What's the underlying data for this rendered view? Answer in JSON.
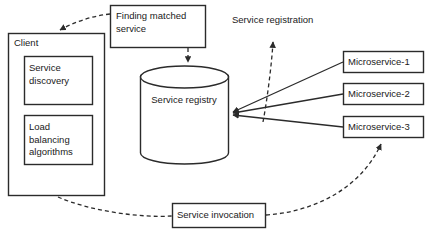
{
  "diagram": {
    "background_color": "#ffffff",
    "stroke_color": "#2b2b2b",
    "text_color": "#1a1a1a",
    "nodes": {
      "client": {
        "label": "Client",
        "shape": "rectangle"
      },
      "service_discovery": {
        "label": "Service\ndiscovery",
        "shape": "rectangle"
      },
      "load_balancing": {
        "label": "Load\nbalancing\nalgorithms",
        "shape": "rectangle"
      },
      "service_registry": {
        "label": "Service registry",
        "shape": "cylinder"
      },
      "finding_matched_service": {
        "label": "Finding matched\nservice",
        "shape": "rectangle"
      },
      "service_invocation": {
        "label": "Service invocation",
        "shape": "rectangle"
      },
      "service_registration": {
        "label": "Service registration",
        "shape": "text-label"
      },
      "microservice_1": {
        "label": "Microservice-1",
        "shape": "rectangle"
      },
      "microservice_2": {
        "label": "Microservice-2",
        "shape": "rectangle"
      },
      "microservice_3": {
        "label": "Microservice-3",
        "shape": "rectangle"
      }
    },
    "edges": [
      {
        "name": "finding-to-client",
        "from": "finding_matched_service",
        "to": "client",
        "style": "dashed",
        "arrow": true
      },
      {
        "name": "finding-to-registry",
        "from": "finding_matched_service",
        "to": "service_registry",
        "style": "dashed",
        "arrow": true
      },
      {
        "name": "microservice-1-to-registry",
        "from": "microservice_1",
        "to": "service_registry",
        "style": "solid",
        "arrow": true
      },
      {
        "name": "microservice-2-to-registry",
        "from": "microservice_2",
        "to": "service_registry",
        "style": "solid",
        "arrow": true
      },
      {
        "name": "microservice-3-to-registry",
        "from": "microservice_3",
        "to": "service_registry",
        "style": "solid",
        "arrow": true
      },
      {
        "name": "registration-callout",
        "from": "microservice_edges",
        "to": "service_registration",
        "style": "dashed",
        "arrow": true
      },
      {
        "name": "client-to-invocation",
        "from": "client",
        "to": "service_invocation",
        "style": "dashed",
        "arrow": false
      },
      {
        "name": "invocation-to-microservice-3",
        "from": "service_invocation",
        "to": "microservice_3",
        "style": "dashed",
        "arrow": true
      }
    ]
  }
}
